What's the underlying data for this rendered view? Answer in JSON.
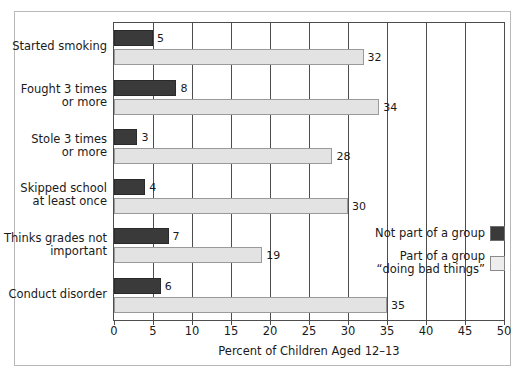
{
  "chart_data": {
    "type": "bar",
    "orientation": "horizontal",
    "title": "",
    "xlabel": "Percent of Children Aged 12–13",
    "ylabel": "",
    "xlim": [
      0,
      50
    ],
    "xticks": [
      0,
      5,
      10,
      15,
      20,
      25,
      30,
      35,
      40,
      45,
      50
    ],
    "grid": "vertical",
    "legend_position": "inside-right",
    "categories": [
      "Started smoking",
      "Fought 3 times\nor more",
      "Stole 3 times\nor more",
      "Skipped school\nat least once",
      "Thinks grades not\nimportant",
      "Conduct disorder"
    ],
    "series": [
      {
        "name": "Not part of a group",
        "color": "#3a3a3a",
        "values": [
          5,
          8,
          3,
          4,
          7,
          6
        ]
      },
      {
        "name": "Part of a group\n“doing bad things”",
        "color": "#e3e3e3",
        "values": [
          32,
          34,
          28,
          30,
          19,
          35
        ]
      }
    ]
  },
  "legend": {
    "items": [
      {
        "label": "Not part of a group",
        "swatch": "dark"
      },
      {
        "label": "Part of a group\n“doing bad things”",
        "swatch": "light"
      }
    ]
  },
  "colors": {
    "dark_bar": "#3a3a3a",
    "light_bar": "#e3e3e3",
    "axis": "#4d4d4d",
    "frame": "#b8b8b8",
    "text": "#1a1a1a",
    "background": "#ffffff"
  }
}
